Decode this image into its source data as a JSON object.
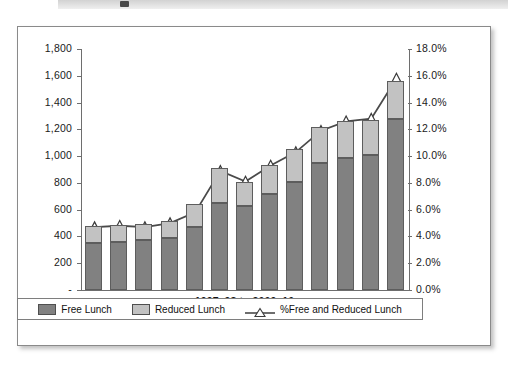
{
  "figure": {
    "header_band": "figure-header-band",
    "xaxis_title": "1997–98 to 2009–10"
  },
  "legend": {
    "items": [
      {
        "label": "Free Lunch",
        "marker": "filled-square-dark-gray",
        "color": "#818181"
      },
      {
        "label": "Reduced Lunch",
        "marker": "filled-square-light-gray",
        "color": "#c2c2c2"
      },
      {
        "label": "%Free and Reduced Lunch",
        "marker": "line-with-hollow-triangle",
        "color": "#4a4a4a"
      }
    ]
  },
  "chart_data": {
    "type": "bar",
    "subtype": "stacked-bar-with-line-overlay",
    "title": "",
    "xlabel": "1997–98 to 2009–10",
    "ylabel": "",
    "y2label": "",
    "categories": [
      "1997–98",
      "1998–99",
      "1999–2000",
      "2000–01",
      "2001–02",
      "2002–03",
      "2003–04",
      "2004–05",
      "2005–06",
      "2006–07",
      "2007–08",
      "2008–09",
      "2009–10"
    ],
    "series": [
      {
        "name": "Free Lunch",
        "axis": "left",
        "color": "#818181",
        "values": [
          350,
          355,
          375,
          385,
          470,
          650,
          625,
          720,
          810,
          950,
          985,
          1010,
          1275
        ]
      },
      {
        "name": "Reduced Lunch",
        "axis": "left",
        "color": "#c2c2c2",
        "values": [
          125,
          130,
          120,
          130,
          175,
          265,
          185,
          215,
          240,
          265,
          275,
          260,
          285
        ]
      },
      {
        "name": "%Free and Reduced Lunch",
        "axis": "right",
        "color": "#4a4a4a",
        "values": [
          4.7,
          4.8,
          4.7,
          5.0,
          5.8,
          8.9,
          8.1,
          9.3,
          10.3,
          11.9,
          12.6,
          12.8,
          15.8
        ]
      }
    ],
    "stack_totals": [
      475,
      485,
      495,
      515,
      645,
      915,
      810,
      935,
      1050,
      1215,
      1260,
      1270,
      1560
    ],
    "ylim": [
      0,
      1800
    ],
    "ytick_step": 200,
    "ytick_labels": [
      "-",
      "200",
      "400",
      "600",
      "800",
      "1,000",
      "1,200",
      "1,400",
      "1,600",
      "1,800"
    ],
    "y2lim": [
      0,
      18
    ],
    "y2tick_step": 2,
    "y2tick_labels": [
      "0.0%",
      "2.0%",
      "4.0%",
      "6.0%",
      "8.0%",
      "10.0%",
      "12.0%",
      "14.0%",
      "16.0%",
      "18.0%"
    ],
    "grid": false,
    "legend_position": "bottom"
  }
}
